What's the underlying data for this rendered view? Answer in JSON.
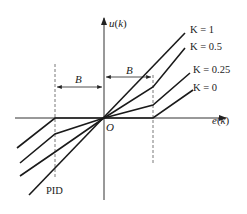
{
  "diagram": {
    "type": "variable-speed integral characteristic",
    "axes": {
      "y_label": "u(k)",
      "x_label": "e(k)",
      "origin_label": "O"
    },
    "threshold": {
      "left_label": "B",
      "right_label": "B"
    },
    "curves": [
      {
        "label": "K = 1"
      },
      {
        "label": "K = 0.5"
      },
      {
        "label": "K = 0.25"
      },
      {
        "label": "K = 0"
      }
    ],
    "annotation": "PID",
    "colors": {
      "line": "#1a1a1a",
      "axis": "#333333",
      "dashed": "#555555"
    }
  }
}
